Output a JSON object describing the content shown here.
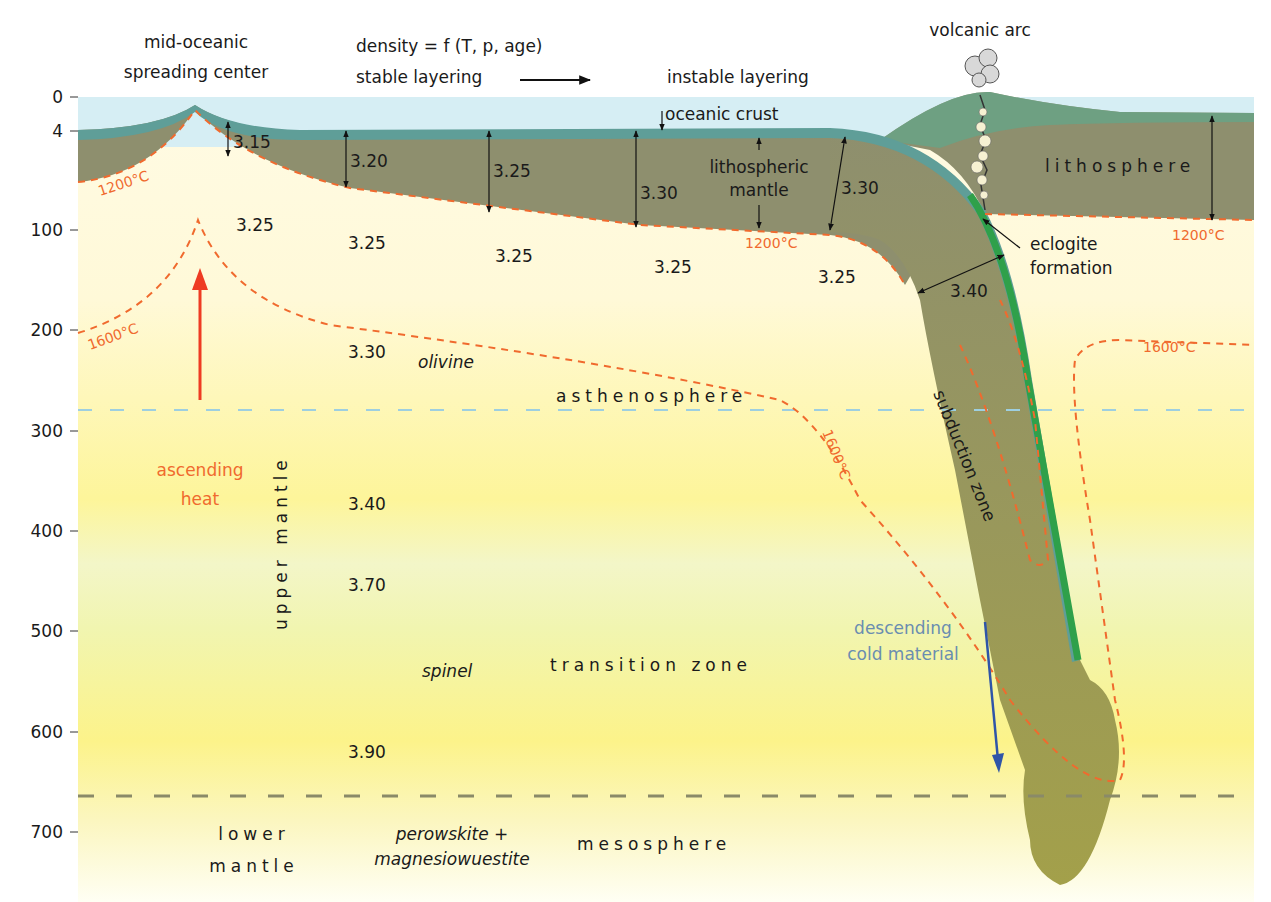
{
  "title_labels": {
    "ridge": [
      "mid-oceanic",
      "spreading center"
    ],
    "density_formula": "density = f (T, p, age)",
    "stable": "stable layering",
    "instable": "instable layering",
    "volcanic_arc": "volcanic arc"
  },
  "depth_axis": {
    "ticks": [
      "0",
      "4",
      "100",
      "200",
      "300",
      "400",
      "500",
      "600",
      "700"
    ]
  },
  "layers": {
    "oceanic_crust": "oceanic crust",
    "lithospheric_mantle": [
      "lithospheric",
      "mantle"
    ],
    "lithosphere": "lithosphere",
    "asthenosphere": "asthenosphere",
    "transition_zone": "transition zone",
    "mesosphere": "mesosphere",
    "upper_mantle": "upper mantle",
    "lower_mantle": [
      "lower",
      "mantle"
    ]
  },
  "minerals": {
    "olivine": "olivine",
    "spinel": "spinel",
    "perowskite": [
      "perowskite +",
      "magnesiowuestite"
    ]
  },
  "processes": {
    "ascending_heat": [
      "ascending",
      "heat"
    ],
    "descending_cold": [
      "descending",
      "cold material"
    ],
    "eclogite": [
      "eclogite",
      "formation"
    ],
    "subduction": "subduction zone"
  },
  "isotherms": {
    "t1200": "1200°C",
    "t1600": "1600°C"
  },
  "densities": {
    "lith": [
      "3.15",
      "3.20",
      "3.25",
      "3.30",
      "3.30"
    ],
    "asth_row": [
      "3.25",
      "3.25",
      "3.25",
      "3.25",
      "3.25"
    ],
    "slab": "3.40",
    "column": [
      "3.30",
      "3.40",
      "3.70",
      "3.90"
    ]
  },
  "colors": {
    "ocean": "#d6eef4",
    "crust": "#5f9e98",
    "lithosphere": "#8e8f6e",
    "isotherm": "#f06a2e",
    "slab_edge": "#2fa04a",
    "heat_arrow": "#ee3b22",
    "cold_arrow": "#2f55a8",
    "cold_text": "#6a8db0"
  }
}
